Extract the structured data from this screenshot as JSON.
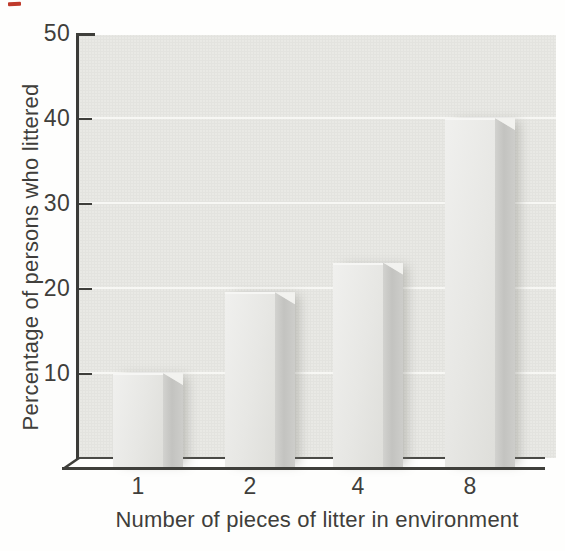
{
  "chart_data": {
    "type": "bar",
    "title": "",
    "categories": [
      "1",
      "2",
      "4",
      "8"
    ],
    "values": [
      10,
      19.5,
      23,
      40
    ],
    "xlabel": "Number of pieces of litter in environment",
    "ylabel": "Percentage of persons who littered",
    "yticks": [
      10,
      20,
      30,
      40,
      50
    ],
    "ylim": [
      0,
      50
    ],
    "grid": true,
    "legend": "none",
    "style": "3d-shaded-bars-grayscale"
  },
  "decorations": {
    "red_mark_color": "#bf3a2b"
  },
  "colors": {
    "plot_background": "#e9e9e5",
    "gridline": "#f7f7f4",
    "axis": "#3b3b38",
    "bar_front": "#e7e7e4",
    "bar_side": "#c3c3c0",
    "text": "#403e3b"
  }
}
